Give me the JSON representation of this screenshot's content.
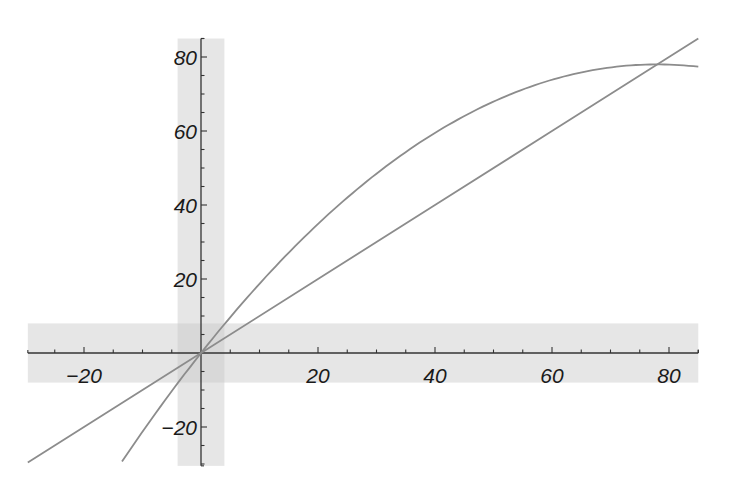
{
  "chart_data": {
    "type": "line",
    "title": "",
    "xlabel": "",
    "ylabel": "",
    "xlim": [
      -29.6,
      85
    ],
    "ylim": [
      -30.5,
      85
    ],
    "grid": false,
    "legend": null,
    "x_ticks": [
      -20,
      20,
      40,
      60,
      80
    ],
    "y_ticks": [
      -20,
      20,
      40,
      60,
      80
    ],
    "x_tick_labels": [
      "-20",
      "20",
      "40",
      "60",
      "80"
    ],
    "y_tick_labels": [
      "-20",
      "20",
      "40",
      "60",
      "80"
    ],
    "minor_tick_step": 5,
    "bands": [
      {
        "orientation": "vertical",
        "x_range": [
          -4,
          4
        ],
        "y_range": [
          -30.5,
          85
        ],
        "color": "#e6e6e6"
      },
      {
        "orientation": "horizontal",
        "y_range": [
          -8,
          8
        ],
        "x_range": [
          -29.6,
          85
        ],
        "color": "#e6e6e6"
      }
    ],
    "series": [
      {
        "name": "line y = x",
        "color": "#8c8c8c",
        "x": [
          -29.6,
          0,
          20,
          40,
          60,
          80,
          85
        ],
        "y": [
          -29.6,
          0,
          20,
          40,
          60,
          80,
          85
        ]
      },
      {
        "name": "curve y = 2x - x^2/78",
        "color": "#8c8c8c",
        "x": [
          -13.5,
          -10,
          0,
          10,
          20,
          30,
          40,
          50,
          60,
          70,
          78,
          85
        ],
        "y": [
          -29.3,
          -21.3,
          0,
          18.7,
          34.9,
          48.5,
          59.5,
          67.9,
          73.8,
          77.2,
          78.0,
          77.4
        ]
      }
    ],
    "annotations": [
      {
        "text": "intersection",
        "x": 77,
        "y": 77
      }
    ]
  }
}
